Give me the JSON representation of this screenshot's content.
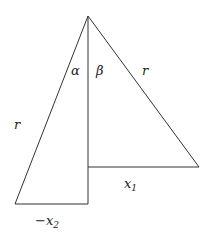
{
  "diagram": {
    "type": "geometry",
    "colors": {
      "stroke": "#333333",
      "text": "#222222",
      "background": "#ffffff"
    },
    "labels": {
      "alpha": "α",
      "beta": "β",
      "r_right": "r",
      "r_left": "r",
      "x1_base": "x",
      "x1_sub": "1",
      "x2_prefix": "−x",
      "x2_sub": "2"
    },
    "vertices": {
      "apex": [
        88,
        16
      ],
      "right_foot": [
        88,
        167
      ],
      "right_corner": [
        199,
        167
      ],
      "left_foot": [
        88,
        204
      ],
      "left_corner": [
        15,
        204
      ]
    }
  }
}
